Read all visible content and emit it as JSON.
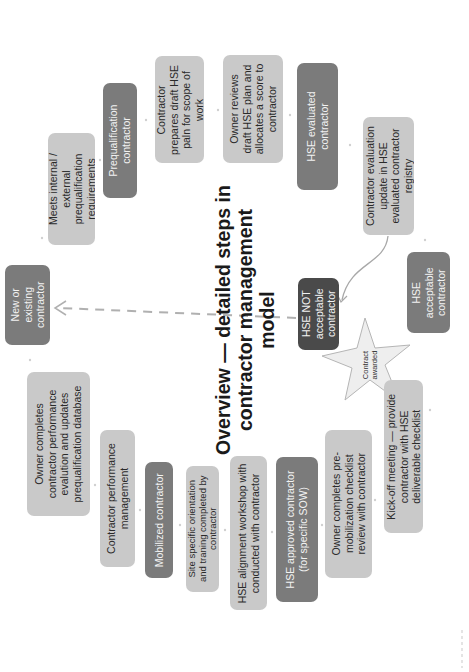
{
  "diagram": {
    "title_lines": [
      "Overview — detailed steps in",
      "contractor management",
      "model"
    ],
    "orientation": "rotated 90 degrees counter-clockwise",
    "colors": {
      "light_box": "#c9c9c9",
      "dark_box": "#7b7b7b",
      "darker_box": "#4a4a4a",
      "connector": "#b0b0b0"
    },
    "nodes": {
      "new_existing": {
        "lines": [
          "New or",
          "existing",
          "contractor"
        ]
      },
      "meets_req": {
        "lines": [
          "Meets internal /",
          "external",
          "prequalification",
          "requirements"
        ]
      },
      "prequal": {
        "lines": [
          "Prequalification",
          "contractor"
        ]
      },
      "draft_hse": {
        "lines": [
          "Contractor",
          "prepares draft HSE",
          "paln for scope of",
          "work"
        ]
      },
      "owner_reviews": {
        "lines": [
          "Owner reviews",
          "draft HSE plan and",
          "allocates a score to",
          "contractor"
        ]
      },
      "hse_evaluated": {
        "lines": [
          "HSE evaluated",
          "contractor"
        ]
      },
      "eval_update": {
        "lines": [
          "Contractor evaluation",
          "update in HSE",
          "evaluated contractor",
          "registry"
        ]
      },
      "not_acceptable": {
        "lines": [
          "HSE NOT",
          "acceptable",
          "contractor"
        ]
      },
      "acceptable": {
        "lines": [
          "HSE",
          "acceptable",
          "contractor"
        ]
      },
      "contract_awarded": {
        "lines": [
          "Contract",
          "awarded"
        ]
      },
      "kickoff": {
        "lines": [
          "Kick-off meeting — provide",
          "contractor with HSE",
          "deliverable checklist"
        ]
      },
      "premob": {
        "lines": [
          "Owner completes pre-",
          "mobilization checklist",
          "review with contractor"
        ]
      },
      "approved": {
        "lines": [
          "HSE approved contractor",
          "(for specific SOW)"
        ]
      },
      "workshop": {
        "lines": [
          "HSE alignment workshop with",
          "conducted with contractor"
        ]
      },
      "orientation": {
        "lines": [
          "Site specific orientation",
          "and traning completed by",
          "contractor"
        ]
      },
      "mobilized": {
        "lines": [
          "Mobilized contractor"
        ]
      },
      "perf_mgmt": {
        "lines": [
          "Contractor performance",
          "management"
        ]
      },
      "perf_eval": {
        "lines": [
          "Owner completes",
          "contractor performance",
          "evalution and updates",
          "prequalification database"
        ]
      }
    }
  }
}
